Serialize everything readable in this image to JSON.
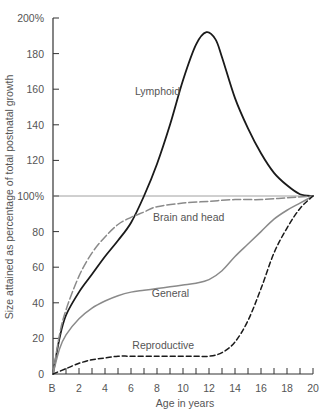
{
  "chart_data": {
    "type": "line",
    "title": "",
    "xlabel": "Age in years",
    "ylabel": "Size attained as percentage of total postnatal growth",
    "xlim": [
      0,
      20
    ],
    "ylim": [
      0,
      200
    ],
    "x_tick_labels": [
      "B",
      "2",
      "4",
      "6",
      "8",
      "10",
      "12",
      "14",
      "16",
      "18",
      "20"
    ],
    "y_tick_labels": [
      "0",
      "20",
      "40",
      "60",
      "80",
      "100%",
      "120",
      "140",
      "160",
      "180",
      "200%"
    ],
    "reference_line": {
      "y": 100
    },
    "grid": false,
    "legend": "inline labels",
    "series": [
      {
        "name": "Lymphoid",
        "style": "solid-black",
        "x": [
          0,
          0.5,
          1,
          2,
          3,
          4,
          5,
          6,
          7,
          8,
          9,
          10,
          11,
          11.8,
          12.5,
          13,
          14,
          15,
          16,
          17,
          18,
          19,
          20
        ],
        "y": [
          0,
          20,
          33,
          46,
          56,
          66,
          75,
          85,
          100,
          118,
          140,
          165,
          185,
          192,
          188,
          178,
          155,
          138,
          124,
          113,
          106,
          101,
          100
        ]
      },
      {
        "name": "Brain and head",
        "style": "dashed-gray",
        "x": [
          0,
          0.5,
          1,
          2,
          3,
          4,
          5,
          6,
          7,
          8,
          10,
          12,
          14,
          16,
          18,
          20
        ],
        "y": [
          0,
          22,
          36,
          55,
          68,
          77,
          84,
          88,
          91,
          94,
          96,
          97,
          98,
          98,
          99,
          100
        ]
      },
      {
        "name": "General",
        "style": "solid-gray",
        "x": [
          0,
          0.5,
          1,
          2,
          3,
          4,
          5,
          6,
          7,
          8,
          9,
          10,
          11,
          12,
          13,
          14,
          15,
          16,
          17,
          18,
          19,
          20
        ],
        "y": [
          0,
          14,
          22,
          31,
          37,
          41,
          44,
          46,
          47,
          48,
          49,
          50,
          51,
          53,
          58,
          66,
          73,
          80,
          87,
          92,
          96,
          100
        ]
      },
      {
        "name": "Reproductive",
        "style": "dashed-black",
        "x": [
          0,
          1,
          2,
          3,
          4,
          5,
          6,
          8,
          10,
          11,
          12,
          13,
          14,
          15,
          16,
          17,
          18,
          19,
          20
        ],
        "y": [
          0,
          3,
          6,
          8,
          9,
          10,
          10,
          10,
          10,
          10,
          10,
          12,
          18,
          30,
          48,
          68,
          82,
          93,
          100
        ]
      }
    ],
    "annotations": [
      {
        "text": "Lymphoid",
        "x": 6.3,
        "y": 157
      },
      {
        "text": "Brain and head",
        "x": 7.7,
        "y": 86
      },
      {
        "text": "General",
        "x": 7.6,
        "y": 43
      },
      {
        "text": "Reproductive",
        "x": 6.1,
        "y": 14
      }
    ]
  }
}
